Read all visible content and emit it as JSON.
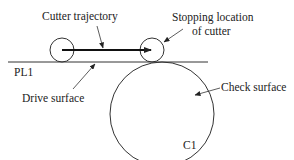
{
  "diagram": {
    "labels": {
      "cutter_trajectory": "Cutter trajectory",
      "stopping_location_line1": "Stopping location",
      "stopping_location_line2": "of cutter",
      "pl1": "PL1",
      "drive_surface": "Drive surface",
      "check_surface": "Check surface",
      "c1": "C1"
    },
    "colors": {
      "stroke": "#333333",
      "text": "#222222",
      "background": "#ffffff"
    }
  }
}
